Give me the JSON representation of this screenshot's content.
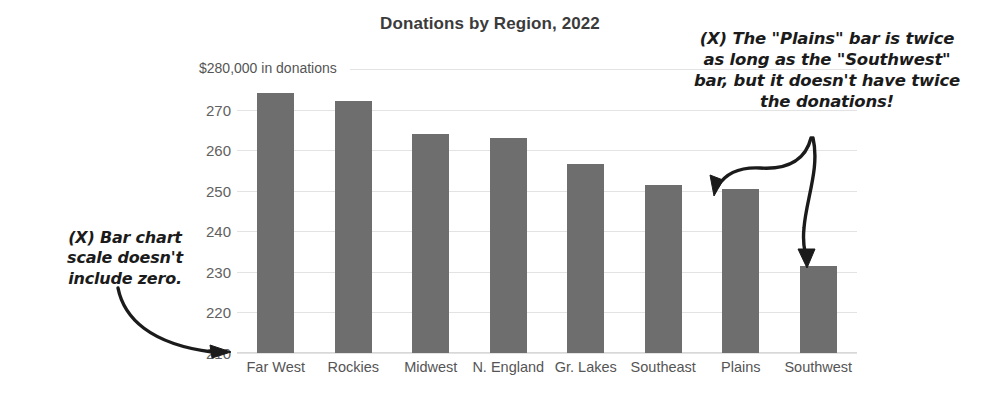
{
  "chart_data": {
    "type": "bar",
    "title": "Donations by Region, 2022",
    "xlabel": "",
    "ylabel": "$280,000 in donations",
    "categories": [
      "Far West",
      "Rockies",
      "Midwest",
      "N. England",
      "Gr. Lakes",
      "Southeast",
      "Plains",
      "Southwest"
    ],
    "values": [
      274,
      272,
      264,
      263,
      256.5,
      251.5,
      250.5,
      231.5
    ],
    "ylim": [
      210,
      280
    ],
    "yticks": [
      210,
      220,
      230,
      240,
      250,
      260,
      270
    ],
    "ytick_labels": [
      "210",
      "220",
      "230",
      "240",
      "250",
      "260",
      "270"
    ],
    "top_axis_label": "$280,000 in donations",
    "grid": true,
    "legend": false,
    "units": "thousands of dollars",
    "bar_color": "#6e6e6e",
    "grid_color": "#e3e3e3",
    "annotations": [
      {
        "id": "scale-annotation",
        "lines": [
          "(X) Bar chart",
          "scale doesn't",
          "include zero."
        ],
        "points_to": "210"
      },
      {
        "id": "bar-length-annotation",
        "lines": [
          "(X) The \"Plains\" bar is twice",
          "as long as the \"Southwest\"",
          "bar, but it doesn't have twice",
          "the donations!"
        ],
        "points_to": "Plains, Southwest"
      }
    ]
  }
}
